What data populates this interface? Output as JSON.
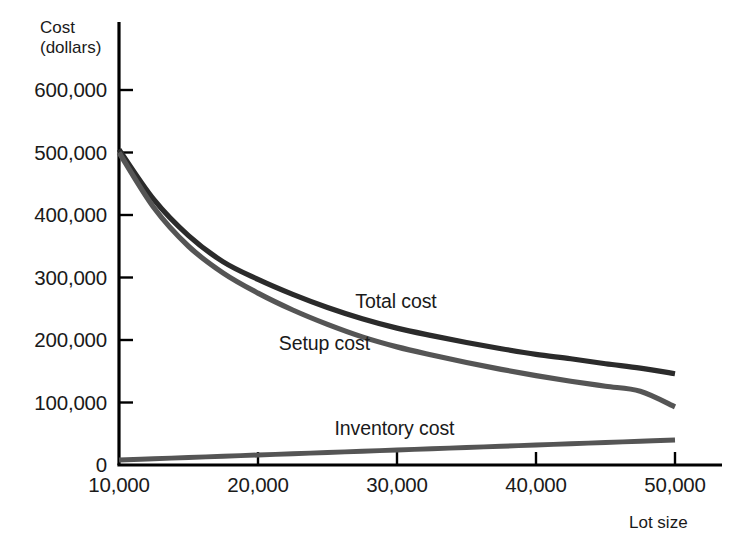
{
  "chart_data": {
    "type": "line",
    "title": "",
    "xlabel": "Lot size",
    "ylabel": "Cost (dollars)",
    "ylabel_line1": "Cost",
    "ylabel_line2": "(dollars)",
    "xlim": [
      10000,
      52000
    ],
    "ylim": [
      0,
      640000
    ],
    "grid": false,
    "legend_position": "inline-annotations",
    "x_ticks": [
      10000,
      20000,
      30000,
      40000,
      50000
    ],
    "x_tick_labels": [
      "10,000",
      "20,000",
      "30,000",
      "40,000",
      "50,000"
    ],
    "y_ticks": [
      0,
      100000,
      200000,
      300000,
      400000,
      500000,
      600000
    ],
    "y_tick_labels": [
      "0",
      "100,000",
      "200,000",
      "300,000",
      "400,000",
      "500,000",
      "600,000"
    ],
    "x": [
      10000,
      12500,
      15000,
      17500,
      20000,
      22500,
      25000,
      27500,
      30000,
      32500,
      35000,
      37500,
      40000,
      42500,
      45000,
      47500,
      50000
    ],
    "series": [
      {
        "name": "Total cost",
        "color": "#2b2b2b",
        "label_x": 27000,
        "label_y": 262000,
        "values": [
          505000,
          425000,
          367000,
          325000,
          297000,
          273000,
          252000,
          234000,
          219000,
          207000,
          196000,
          186000,
          177000,
          170000,
          162000,
          155000,
          146000
        ]
      },
      {
        "name": "Setup cost",
        "color": "#555555",
        "label_x": 21500,
        "label_y": 196000,
        "values": [
          500000,
          412000,
          350000,
          307000,
          275000,
          248000,
          225000,
          205000,
          189000,
          176000,
          164000,
          153000,
          143000,
          134000,
          126000,
          118000,
          93000
        ]
      },
      {
        "name": "Inventory cost",
        "color": "#555555",
        "label_x": 25500,
        "label_y": 60000,
        "values": [
          8000,
          10000,
          12000,
          14000,
          16000,
          18000,
          20000,
          22000,
          24000,
          26000,
          28000,
          30000,
          32000,
          34000,
          36000,
          38000,
          40000
        ]
      }
    ]
  },
  "axis_colors": {
    "axis_line": "#000000",
    "tick_mark": "#000000",
    "background": "#ffffff"
  }
}
